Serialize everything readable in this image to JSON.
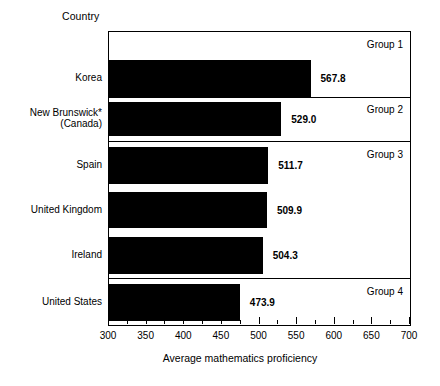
{
  "header": {
    "category_axis_title": "Country"
  },
  "chart_data": {
    "type": "bar",
    "orientation": "horizontal",
    "title": "",
    "xlabel": "Average mathematics proficiency",
    "ylabel": "Country",
    "xlim": [
      300,
      700
    ],
    "xticks": [
      300,
      350,
      400,
      450,
      500,
      550,
      600,
      650,
      700
    ],
    "xtick_labels": [
      "300",
      "350",
      "400",
      "450",
      "500",
      "550",
      "600",
      "650",
      "700"
    ],
    "minor_tick_step": 25,
    "grid": false,
    "legend": "none",
    "bar_color": "#000000",
    "categories": [
      "Korea",
      "New Brunswick* (Canada)",
      "Spain",
      "United Kingdom",
      "Ireland",
      "United States"
    ],
    "values": [
      567.8,
      529.0,
      511.7,
      509.9,
      504.3,
      473.9
    ],
    "value_labels": [
      "567.8",
      "529.0",
      "511.7",
      "509.9",
      "504.3",
      "473.9"
    ],
    "groups": [
      {
        "label": "Group 1",
        "categories": [
          "Korea"
        ]
      },
      {
        "label": "Group 2",
        "categories": [
          "New Brunswick* (Canada)"
        ]
      },
      {
        "label": "Group 3",
        "categories": [
          "Spain",
          "United Kingdom",
          "Ireland"
        ]
      },
      {
        "label": "Group 4",
        "categories": [
          "United States"
        ]
      }
    ]
  },
  "bars": [
    {
      "name": "korea",
      "label_line1": "Korea",
      "label_line2": "",
      "value": 567.8,
      "value_label": "567.8"
    },
    {
      "name": "new-brunswick-canada",
      "label_line1": "New Brunswick*",
      "label_line2": "(Canada)",
      "value": 529.0,
      "value_label": "529.0"
    },
    {
      "name": "spain",
      "label_line1": "Spain",
      "label_line2": "",
      "value": 511.7,
      "value_label": "511.7"
    },
    {
      "name": "united-kingdom",
      "label_line1": "United Kingdom",
      "label_line2": "",
      "value": 509.9,
      "value_label": "509.9"
    },
    {
      "name": "ireland",
      "label_line1": "Ireland",
      "label_line2": "",
      "value": 504.3,
      "value_label": "504.3"
    },
    {
      "name": "united-states",
      "label_line1": "United States",
      "label_line2": "",
      "value": 473.9,
      "value_label": "473.9"
    }
  ],
  "groups": [
    {
      "name": "group-1",
      "label": "Group 1"
    },
    {
      "name": "group-2",
      "label": "Group 2"
    },
    {
      "name": "group-3",
      "label": "Group 3"
    },
    {
      "name": "group-4",
      "label": "Group 4"
    }
  ],
  "axis": {
    "title": "Average mathematics proficiency",
    "ticks": [
      "300",
      "350",
      "400",
      "450",
      "500",
      "550",
      "600",
      "650",
      "700"
    ]
  }
}
